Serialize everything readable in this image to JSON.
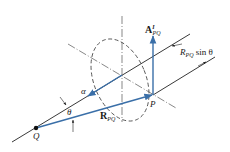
{
  "diagram": {
    "labels": {
      "A_main": "A",
      "A_sup": "I",
      "A_sub": "PQ",
      "Rsin_R": "R",
      "Rsin_sub": "PQ",
      "Rsin_tail": " sin θ",
      "alpha": "α",
      "theta": "θ",
      "R_main": "R",
      "R_sub": "PQ",
      "P": "P",
      "Q": "Q"
    },
    "colors": {
      "vector": "#3a6fa8",
      "line": "#222222",
      "dashed": "#555555"
    }
  }
}
